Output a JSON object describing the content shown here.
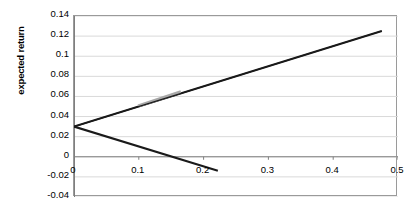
{
  "chart_data": {
    "type": "line",
    "title": "",
    "xlabel": "",
    "ylabel": "expected return",
    "xlim": [
      0.0,
      0.5
    ],
    "ylim": [
      -0.04,
      0.14
    ],
    "xticks": [
      "0",
      "0.1",
      "0.2",
      "0.3",
      "0.4",
      "0.5"
    ],
    "xtick_values": [
      0,
      0.1,
      0.2,
      0.3,
      0.4,
      0.5
    ],
    "yticks": [
      "0.14",
      "0.12",
      "0.1",
      "0.08",
      "0.06",
      "0.04",
      "0.02",
      "0",
      "-0.02",
      "-0.04"
    ],
    "ytick_values": [
      0.14,
      0.12,
      0.1,
      0.08,
      0.06,
      0.04,
      0.02,
      0,
      -0.02,
      -0.04
    ],
    "grid": true,
    "grid_axis": "y",
    "legend": "none",
    "series": [
      {
        "name": "upper-branch",
        "color": "#1a1a1a",
        "x": [
          0.0,
          0.475
        ],
        "values": [
          0.03,
          0.125
        ]
      },
      {
        "name": "lower-branch",
        "color": "#1a1a1a",
        "x": [
          0.0,
          0.222
        ],
        "values": [
          0.03,
          -0.014
        ]
      },
      {
        "name": "highlighted-segment",
        "color": "#a8a8a8",
        "x": [
          0.099,
          0.165
        ],
        "values": [
          0.0505,
          0.0645
        ]
      }
    ],
    "annotations": []
  },
  "axis": {
    "y_title": "expected return"
  },
  "colors": {
    "line": "#1a1a1a",
    "highlight": "#a8a8a8",
    "grid": "#d9d9d9",
    "frame": "#9a9a9a",
    "axis": "#7f7f7f",
    "background": "#ffffff"
  }
}
